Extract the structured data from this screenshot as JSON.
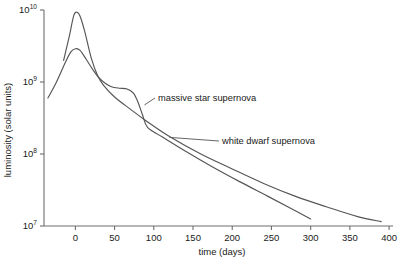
{
  "chart_data": {
    "type": "line",
    "title": "",
    "xlabel": "time (days)",
    "ylabel": "luminosity (solar units)",
    "yscale": "log",
    "xlim": [
      -40,
      405
    ],
    "ylim": [
      10000000,
      10000000000
    ],
    "grid": false,
    "legend_position": "inline-annotations",
    "xticks": [
      0,
      50,
      100,
      150,
      200,
      250,
      300,
      350,
      400
    ],
    "xticklabels": [
      "0",
      "50",
      "100",
      "150",
      "200",
      "250",
      "300",
      "350",
      "400"
    ],
    "yticks": [
      10000000,
      100000000,
      1000000000,
      10000000000
    ],
    "yticklabels": [
      "10^7",
      "10^8",
      "10^9",
      "10^10"
    ],
    "ytick_mantissa": [
      "10",
      "10",
      "10",
      "10"
    ],
    "ytick_exponent": [
      "7",
      "8",
      "9",
      "10"
    ],
    "series": [
      {
        "name": "white dwarf supernova",
        "color": "#555555",
        "x": [
          -15,
          -8,
          -2,
          2,
          6,
          12,
          20,
          28,
          36,
          50,
          70,
          90,
          120,
          160,
          200,
          240,
          280,
          320,
          360,
          390
        ],
        "values": [
          2000000000.0,
          4200000000.0,
          8400000000.0,
          9300000000.0,
          8200000000.0,
          5000000000.0,
          2200000000.0,
          1250000000.0,
          900000000.0,
          620000000.0,
          420000000.0,
          290000000.0,
          175000000.0,
          100000000.0,
          62000000.0,
          39000000.0,
          26000000.0,
          18500000.0,
          13500000.0,
          11500000.0
        ]
      },
      {
        "name": "massive star supernova",
        "color": "#555555",
        "x": [
          -35,
          -25,
          -14,
          -6,
          0,
          6,
          14,
          22,
          30,
          38,
          46,
          56,
          66,
          74,
          80,
          86,
          92,
          110,
          140,
          175,
          210,
          245,
          275,
          300
        ],
        "values": [
          600000000.0,
          950000000.0,
          1750000000.0,
          2600000000.0,
          2900000000.0,
          2750000000.0,
          2050000000.0,
          1500000000.0,
          1150000000.0,
          960000000.0,
          860000000.0,
          820000000.0,
          800000000.0,
          700000000.0,
          520000000.0,
          340000000.0,
          235000000.0,
          175000000.0,
          110000000.0,
          66000000.0,
          41000000.0,
          26000000.0,
          17500000.0,
          12500000.0
        ]
      }
    ],
    "annotations": [
      {
        "text": "massive star supernova",
        "target_x": 88,
        "target_y": 480000000
      },
      {
        "text": "white dwarf supernova",
        "target_x": 120,
        "target_y": 170000000
      }
    ]
  }
}
